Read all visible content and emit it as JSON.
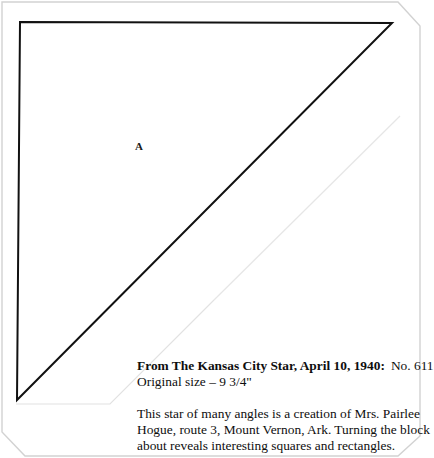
{
  "document": {
    "type": "quilt-block-pattern-clipping",
    "piece_label": "A",
    "caption": {
      "source_line": "From The Kansas City Star, April 10, 1940:",
      "pattern_number": "No. 611",
      "size_line": "Original size – 9 3/4\""
    },
    "description": {
      "line1": "This star of many angles is a creation of Mrs. Pairlee",
      "line2": "Hogue, route 3, Mount Vernon, Ark. Turning the block",
      "line3": "about reveals interesting squares and rectangles."
    }
  },
  "diagram": {
    "shape": "right-triangle",
    "stroke_color": "#111111",
    "fill_color": "#ffffff",
    "stroke_width": 2,
    "vertices": [
      {
        "x": 20,
        "y": 22
      },
      {
        "x": 392,
        "y": 23
      },
      {
        "x": 17,
        "y": 400
      }
    ]
  },
  "page_edge": {
    "stroke_color": "#d2d2d2",
    "corner_bevel": 22
  },
  "colors": {
    "background": "#ffffff",
    "ink": "#111111",
    "paper_edge": "#d2d2d2"
  }
}
